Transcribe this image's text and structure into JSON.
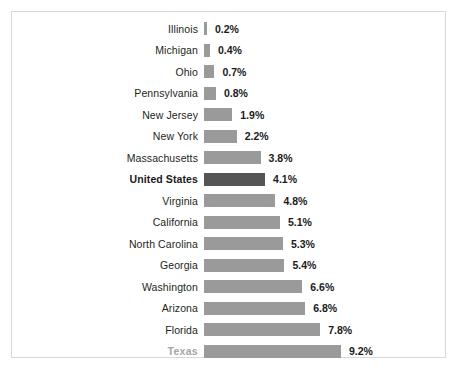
{
  "chart_data": {
    "type": "bar",
    "orientation": "horizontal",
    "title": "",
    "subtitle": "",
    "xlabel": "",
    "ylabel": "",
    "grid": false,
    "legend": "none",
    "axis_visible": false,
    "xlim": [
      0,
      9.2
    ],
    "value_suffix": "%",
    "categories": [
      "Illinois",
      "Michigan",
      "Ohio",
      "Pennsylvania",
      "New Jersey",
      "New York",
      "Massachusetts",
      "United States",
      "Virginia",
      "California",
      "North Carolina",
      "Georgia",
      "Washington",
      "Arizona",
      "Florida",
      "Texas"
    ],
    "values": [
      0.2,
      0.4,
      0.7,
      0.8,
      1.9,
      2.2,
      3.8,
      4.1,
      4.8,
      5.1,
      5.3,
      5.4,
      6.6,
      6.8,
      7.8,
      9.2
    ],
    "value_labels": [
      "0.2%",
      "0.4%",
      "0.7%",
      "0.8%",
      "1.9%",
      "2.2%",
      "3.8%",
      "4.1%",
      "4.8%",
      "5.1%",
      "5.3%",
      "5.4%",
      "6.6%",
      "6.8%",
      "7.8%",
      "9.2%"
    ],
    "colors": {
      "bar_default": "#9a9a9a",
      "bar_highlight": "#555555",
      "label_default": "#231f20",
      "label_highlight": "#1a1a1a",
      "label_muted": "#a6a6a6",
      "frame_border": "#d8d8d8",
      "background": "#ffffff"
    },
    "highlighted_category": "United States",
    "muted_category": "Texas"
  }
}
